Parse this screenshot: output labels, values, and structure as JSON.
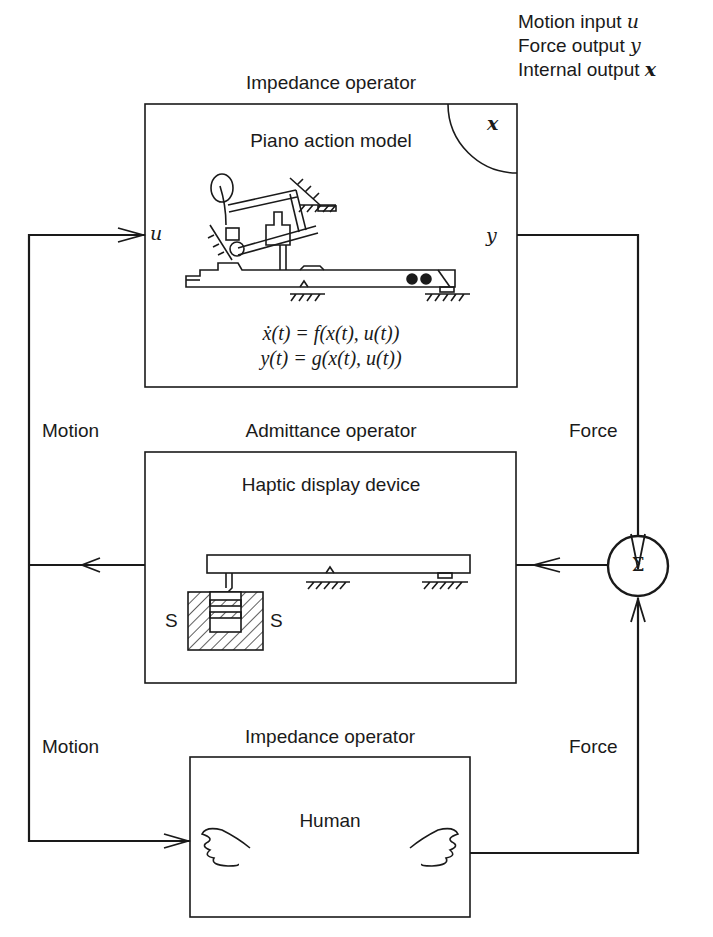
{
  "legend": {
    "motion_input": "Motion input",
    "motion_input_var": "u",
    "force_output": "Force output",
    "force_output_var": "y",
    "internal_output": "Internal output",
    "internal_output_var": "x"
  },
  "blocks": [
    {
      "operator": "Impedance operator",
      "title": "Piano action model",
      "input_var": "u",
      "output_var": "y",
      "state_var": "x",
      "equations": [
        "ẋ(t) = f(x(t), u(t))",
        "y(t) = g(x(t), u(t))"
      ]
    },
    {
      "operator": "Admittance operator",
      "title": "Haptic display device",
      "magnet_labels": [
        "S",
        "S"
      ]
    },
    {
      "operator": "Impedance operator",
      "title": "Human"
    }
  ],
  "signals": {
    "motion_upper": "Motion",
    "motion_lower": "Motion",
    "force_upper": "Force",
    "force_lower": "Force",
    "summing_junction": "Σ"
  },
  "colors": {
    "line": "#1a1a1a",
    "background": "#ffffff"
  }
}
